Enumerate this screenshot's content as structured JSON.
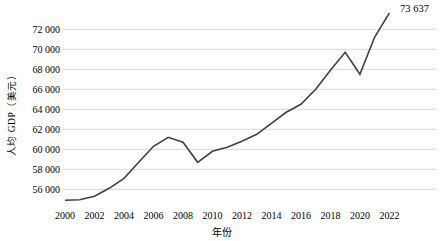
{
  "window": {
    "width": 442,
    "height": 241,
    "background": "#ffffff"
  },
  "chart_data": {
    "type": "line",
    "title": "",
    "xlabel": "年份",
    "ylabel": "人均 GDP（美元）",
    "x": [
      2000,
      2001,
      2002,
      2003,
      2004,
      2005,
      2006,
      2007,
      2008,
      2009,
      2010,
      2011,
      2012,
      2013,
      2014,
      2015,
      2016,
      2017,
      2018,
      2019,
      2020,
      2021,
      2022
    ],
    "values": [
      54900,
      54950,
      55300,
      56100,
      57100,
      58700,
      60300,
      61200,
      60700,
      58700,
      59800,
      60200,
      60800,
      61500,
      62600,
      63700,
      64500,
      66000,
      67900,
      69700,
      67500,
      71200,
      73637
    ],
    "end_label": "73 637",
    "x_tick_years": [
      2000,
      2002,
      2004,
      2006,
      2008,
      2010,
      2012,
      2014,
      2016,
      2018,
      2020,
      2022
    ],
    "x_tick_labels": [
      "2000",
      "2002",
      "2004",
      "2006",
      "2008",
      "2010",
      "2012",
      "2014",
      "2016",
      "2018",
      "2020",
      "2022"
    ],
    "y_tick_values": [
      56000,
      58000,
      60000,
      62000,
      64000,
      66000,
      68000,
      70000,
      72000
    ],
    "y_tick_labels": [
      "56 000",
      "58 000",
      "60 000",
      "62 000",
      "64 000",
      "66 000",
      "68 000",
      "70 000",
      "72 000"
    ],
    "xlim": [
      2000,
      2022
    ],
    "ylim": [
      54000,
      74000
    ],
    "grid": "horizontal-only",
    "legend": "none",
    "line_color": "#404040",
    "grid_color": "#d9d9d9",
    "text_color": "#000000"
  }
}
